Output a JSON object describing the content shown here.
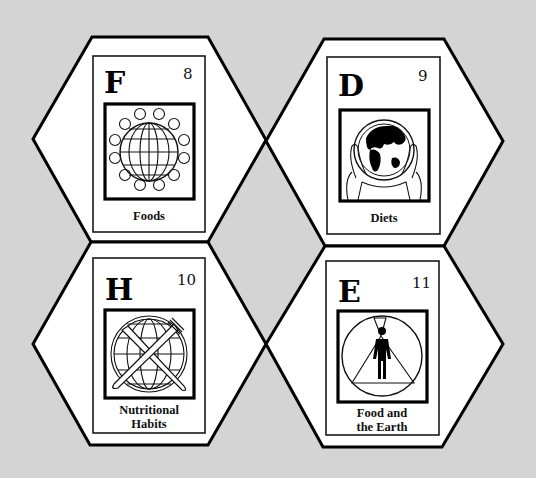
{
  "background_color": "#d4d4d4",
  "tiles": [
    {
      "letter": "F",
      "number": "8",
      "label_lines": [
        "Foods"
      ],
      "icon": "globe-ringed-by-plates-icon"
    },
    {
      "letter": "D",
      "number": "9",
      "label_lines": [
        "Diets"
      ],
      "icon": "hands-holding-earth-icon"
    },
    {
      "letter": "H",
      "number": "10",
      "label_lines": [
        "Nutritional",
        "Habits"
      ],
      "icon": "globe-with-crossed-knife-fork-icon"
    },
    {
      "letter": "E",
      "number": "11",
      "label_lines": [
        "Food and",
        "the Earth"
      ],
      "icon": "person-in-light-beam-icon"
    }
  ]
}
